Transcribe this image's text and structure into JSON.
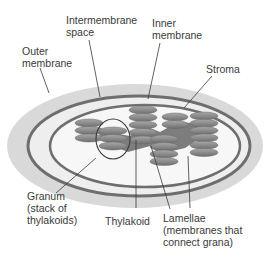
{
  "diagram": {
    "labels": {
      "outer_membrane": "Outer\nmembrane",
      "intermembrane_space": "Intermembrane\nspace",
      "inner_membrane": "Inner\nmembrane",
      "stroma": "Stroma",
      "granum": "Granum\n(stack of\nthylakoids)",
      "thylakoid": "Thylakoid",
      "lamellae": "Lamellae\n(membranes that\nconnect grana)"
    },
    "grana": [
      {
        "name": "left-granum",
        "discs": 3
      },
      {
        "name": "circled-granum",
        "discs": 3
      },
      {
        "name": "center-tall-granum",
        "discs": 5
      },
      {
        "name": "center-right-granum",
        "discs": 4
      },
      {
        "name": "right-small-granum",
        "discs": 2
      },
      {
        "name": "right-tall-granum",
        "discs": 6
      }
    ],
    "colors": {
      "outer_fill": "#d9d9d9",
      "membrane_dark": "#6e6e6e",
      "intermembrane_fill": "#eeeeee",
      "stroma_fill": "#f7f7f7",
      "disc_fill": "#8f8f8f",
      "disc_edge": "#6a6a6a",
      "lamella_fill": "#7d7d7d",
      "leader_line": "#3a3a3a",
      "text": "#3a3a3a"
    }
  }
}
